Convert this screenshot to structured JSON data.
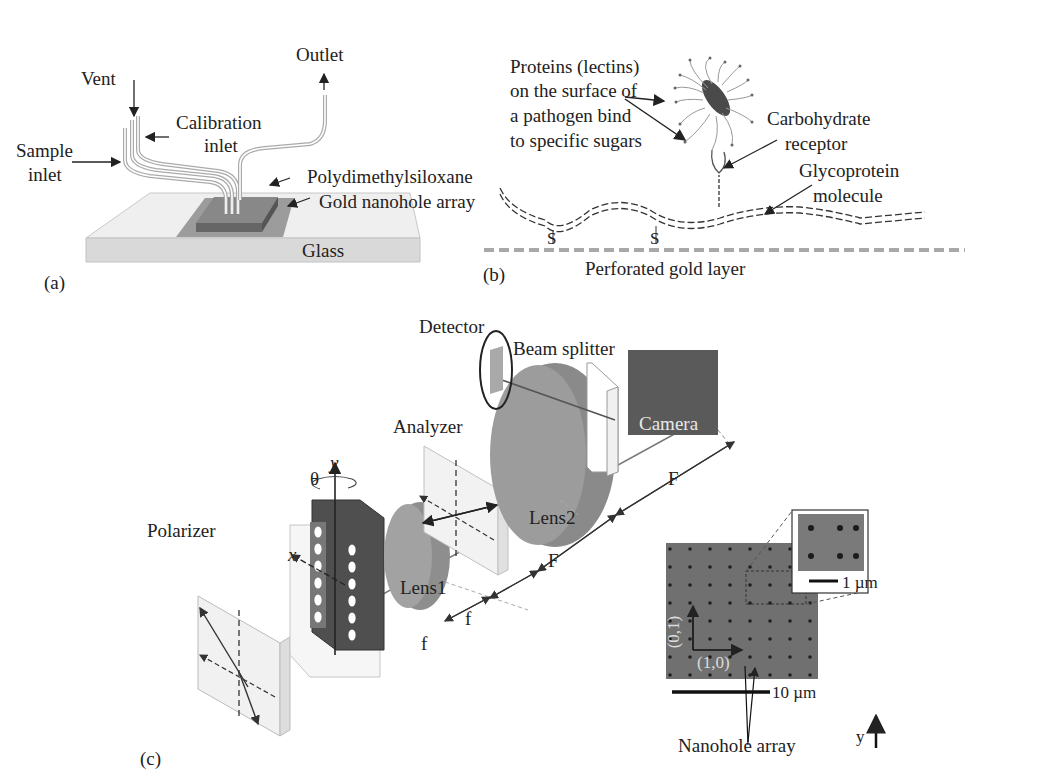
{
  "figure": {
    "panels": [
      {
        "id": "a",
        "tag": "(a)"
      },
      {
        "id": "b",
        "tag": "(b)"
      },
      {
        "id": "c",
        "tag": "(c)"
      }
    ]
  },
  "panel_a": {
    "tag": "(a)",
    "labels": {
      "vent": "Vent",
      "outlet": "Outlet",
      "calibration_inlet_1": "Calibration",
      "calibration_inlet_2": "inlet",
      "sample_inlet_1": "Sample",
      "sample_inlet_2": "inlet",
      "pdms": "Polydimethylsiloxane",
      "gold_array": "Gold nanohole array",
      "glass": "Glass"
    }
  },
  "panel_b": {
    "tag": "(b)",
    "labels": {
      "proteins_1": "Proteins (lectins)",
      "proteins_2": "on the surface of",
      "proteins_3": "a pathogen bind",
      "proteins_4": "to specific sugars",
      "carb_1": "Carbohydrate",
      "carb_2": "receptor",
      "glyco_1": "Glycoprotein",
      "glyco_2": "molecule",
      "s1": "S",
      "s2": "S",
      "gold_layer": "Perforated gold layer"
    }
  },
  "panel_c": {
    "tag": "(c)",
    "labels": {
      "detector": "Detector",
      "beam_splitter": "Beam splitter",
      "camera": "Camera",
      "analyzer": "Analyzer",
      "lens2": "Lens2",
      "lens1": "Lens1",
      "polarizer": "Polarizer",
      "theta": "θ",
      "y_axis": "y",
      "x_axis": "x",
      "F_upper": "F",
      "F_lower": "F",
      "f_upper": "f",
      "f_lower": "f",
      "nanohole_array": "Nanohole array",
      "scale_10um": "10 µm",
      "scale_1um": "1 µm",
      "dir_01": "(0,1)",
      "dir_10": "(1,0)",
      "y_indicator": "y"
    }
  },
  "colors": {
    "glass": "#e6e6e6",
    "gold_film": "#9a9a9a",
    "pdms": "#7a7a7a",
    "lens": "#8c8c8c",
    "camera": "#595959",
    "sem": "#6e6e6e",
    "line": "#222222"
  }
}
